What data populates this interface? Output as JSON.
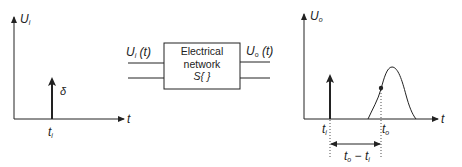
{
  "input_plot": {
    "y_axis_label": "U",
    "y_axis_sub": "i",
    "x_axis_label": "t",
    "impulse_label": "δ",
    "impulse_time_label": "t",
    "impulse_time_sub": "i"
  },
  "network": {
    "input_label": "U",
    "input_sub": "i",
    "input_arg": "(t)",
    "output_label": "U",
    "output_sub": "o",
    "output_arg": "(t)",
    "line1": "Electrical",
    "line2": "network",
    "line3": "S{ }"
  },
  "output_plot": {
    "y_axis_label": "U",
    "y_axis_sub": "o",
    "x_axis_label": "t",
    "impulse_time_label": "t",
    "impulse_time_sub": "i",
    "response_time_label": "t",
    "response_time_sub": "o",
    "delay_label": "t",
    "delay_sub_o": "o",
    "delay_minus": " − ",
    "delay_label2": "t",
    "delay_sub_i": "i"
  },
  "colors": {
    "stroke": "#222222",
    "background": "#ffffff"
  }
}
